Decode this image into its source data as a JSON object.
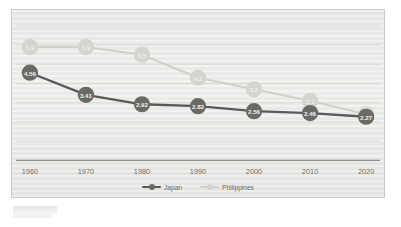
{
  "chart_data": {
    "type": "line",
    "title": "",
    "subtitle": "",
    "xlabel": "",
    "ylabel": "",
    "categories": [
      "1960",
      "1970",
      "1980",
      "1990",
      "2000",
      "2010",
      "2020"
    ],
    "xticklabels": [
      "1960",
      "1970",
      "1980",
      "1990",
      "2000",
      "2010",
      "2020"
    ],
    "ylim": [
      0,
      7
    ],
    "grid": true,
    "legend_position": "bottom",
    "series": [
      {
        "name": "Japan",
        "color": "#6a6a67",
        "line_color": "#5a5a58",
        "label_color": "#f2f2f0",
        "values": [
          4.56,
          3.41,
          2.92,
          2.82,
          2.56,
          2.46,
          2.27
        ],
        "point_labels": [
          "4.56",
          "3.41",
          "2.92",
          "2.82",
          "2.56",
          "2.46",
          "2.27"
        ]
      },
      {
        "name": "Philippines",
        "color": "#d4d4d0",
        "line_color": "#cfcfcb",
        "label_color": "#efefed",
        "values": [
          5.9,
          5.9,
          5.5,
          4.3,
          3.7,
          3.1,
          2.4
        ],
        "point_labels": [
          "5.9",
          "5.9",
          "5.5",
          "4.3",
          "3.7",
          "3.1",
          "2.4"
        ]
      }
    ]
  },
  "legend": {
    "items": [
      {
        "label": "Japan",
        "color": "#6a6a67"
      },
      {
        "label": "Philippines",
        "color": "#d4d4d0"
      }
    ]
  },
  "colors": {
    "japan": "#6a6a67",
    "philippines": "#d4d4d0",
    "plot_background": "#eaeae8",
    "gridline": "#d2d2cf",
    "axis": "#8e8e8b",
    "tick_text": "#6f6f6c"
  }
}
